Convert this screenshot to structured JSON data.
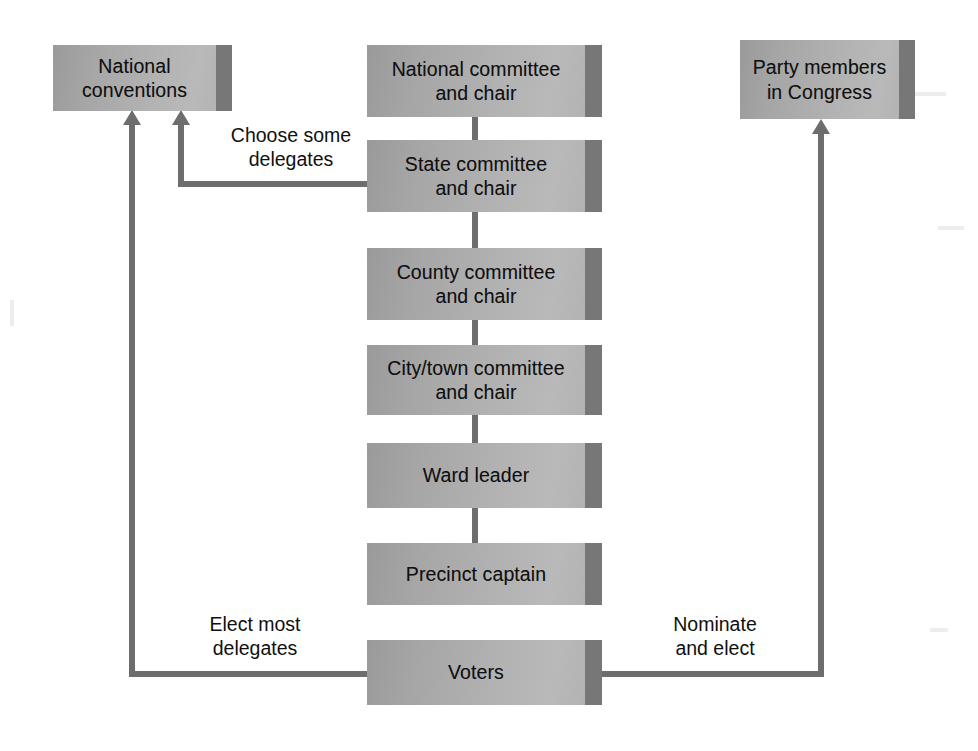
{
  "diagram": {
    "colors": {
      "box_fill_light": "#b9b9b9",
      "box_fill_dark": "#9a9a9a",
      "box_shadow_strip": "#777777",
      "connector": "#6d6d6d",
      "text": "#101010",
      "background": "#ffffff"
    },
    "nodes": [
      {
        "id": "national-conventions",
        "label": "National\nconventions"
      },
      {
        "id": "national-committee",
        "label": "National committee\nand chair"
      },
      {
        "id": "state-committee",
        "label": "State committee\nand chair"
      },
      {
        "id": "county-committee",
        "label": "County committee\nand chair"
      },
      {
        "id": "city-town-committee",
        "label": "City/town committee\nand chair"
      },
      {
        "id": "ward-leader",
        "label": "Ward leader"
      },
      {
        "id": "precinct-captain",
        "label": "Precinct captain"
      },
      {
        "id": "voters",
        "label": "Voters"
      },
      {
        "id": "party-members-congress",
        "label": "Party members\nin Congress"
      }
    ],
    "edge_labels": [
      {
        "id": "choose-some-delegates",
        "label": "Choose some\ndelegates",
        "from": "state-committee",
        "to": "national-conventions"
      },
      {
        "id": "elect-most-delegates",
        "label": "Elect most\ndelegates",
        "from": "voters",
        "to": "national-conventions"
      },
      {
        "id": "nominate-and-elect",
        "label": "Nominate\nand elect",
        "from": "voters",
        "to": "party-members-congress"
      }
    ],
    "chain": [
      "national-committee",
      "state-committee",
      "county-committee",
      "city-town-committee",
      "ward-leader",
      "precinct-captain"
    ]
  }
}
